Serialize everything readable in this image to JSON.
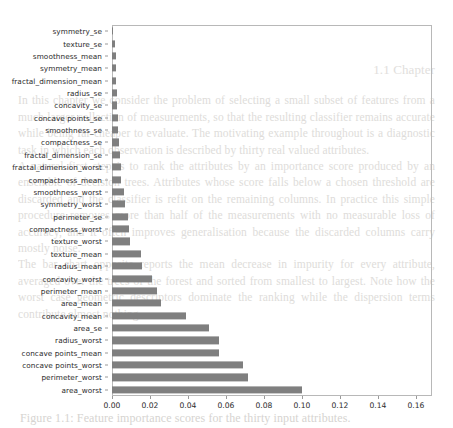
{
  "figure": {
    "background_color": "#ffffff",
    "bar_color": "#7f7f7f",
    "axis_color": "#b8b8b8",
    "tick_label_color": "#2b2b2b"
  },
  "page_bleed": {
    "heading": "1.1 Chapter",
    "paragraph_1": "In this chapter we consider the problem of selecting a small subset of features from a much larger collection of measurements, so that the resulting classifier remains accurate while being far cheaper to evaluate. The motivating example throughout is a diagnostic task in which each observation is described by thirty real valued attributes.",
    "paragraph_2": "A natural first step is to rank the attributes by an importance score produced by an ensemble of decision trees. Attributes whose score falls below a chosen threshold are discarded and the classifier is refit on the remaining columns. In practice this simple procedure removes more than half of the measurements with no measurable loss of accuracy, and it often improves generalisation because the discarded columns carry mostly noise.",
    "paragraph_3": "The bar chart opposite reports the mean decrease in impurity for every attribute, averaged over the trees of the forest and sorted from smallest to largest. Note how the worst case geometric descriptors dominate the ranking while the dispersion terms contribute almost nothing.",
    "caption": "Figure 1.1: Feature importance scores for the thirty input attributes."
  },
  "chart_data": {
    "type": "bar",
    "orientation": "horizontal",
    "title": "",
    "xlabel": "",
    "ylabel": "",
    "xlim": [
      0.0,
      0.1685
    ],
    "grid": false,
    "legend": null,
    "xticks": [
      0.0,
      0.02,
      0.04,
      0.06,
      0.08,
      0.1,
      0.12,
      0.14,
      0.16
    ],
    "xticklabels": [
      "0.00",
      "0.02",
      "0.04",
      "0.06",
      "0.08",
      "0.10",
      "0.12",
      "0.14",
      "0.16"
    ],
    "categories": [
      "symmetry_se",
      "texture_se",
      "smoothness_mean",
      "symmetry_mean",
      "fractal_dimension_mean",
      "radius_se",
      "concavity_se",
      "concave points_se",
      "smoothness_se",
      "compactness_se",
      "fractal_dimension_se",
      "fractal_dimension_worst",
      "compactness_mean",
      "smoothness_worst",
      "symmetry_worst",
      "perimeter_se",
      "compactness_worst",
      "texture_worst",
      "texture_mean",
      "radius_mean",
      "concavity_worst",
      "perimeter_mean",
      "area_mean",
      "concavity_mean",
      "area_se",
      "radius_worst",
      "concave points_mean",
      "concave points_worst",
      "perimeter_worst",
      "area_worst"
    ],
    "values": [
      0.0003,
      0.0017,
      0.0019,
      0.002,
      0.0021,
      0.0024,
      0.0028,
      0.003,
      0.0032,
      0.0036,
      0.0042,
      0.0047,
      0.0048,
      0.0063,
      0.0066,
      0.0085,
      0.0092,
      0.0095,
      0.0152,
      0.0159,
      0.0213,
      0.0238,
      0.0259,
      0.039,
      0.051,
      0.0562,
      0.0566,
      0.069,
      0.0717,
      0.1
    ]
  }
}
